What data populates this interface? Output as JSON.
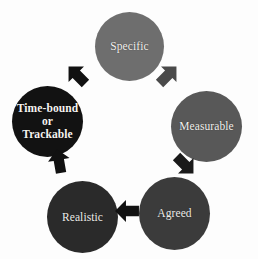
{
  "diagram": {
    "title": "SMART Goals Cycle",
    "type": "cycle-diagram",
    "background_color": "#fdfdfd",
    "direction": "clockwise",
    "nodes": [
      {
        "id": "specific",
        "label": "Specific",
        "position": "top",
        "fill_color": "#6e6e6e",
        "text_color": "#f3f2ee"
      },
      {
        "id": "measurable",
        "label": "Measurable",
        "position": "right",
        "fill_color": "#585858",
        "text_color": "#f3f2ee"
      },
      {
        "id": "agreed",
        "label": "Agreed",
        "position": "bottom-right",
        "fill_color": "#3b3b3b",
        "text_color": "#efeeea"
      },
      {
        "id": "realistic",
        "label": "Realistic",
        "position": "bottom-left",
        "fill_color": "#2a2a2a",
        "text_color": "#efeeea"
      },
      {
        "id": "timebound",
        "label": "Time-bound or Trackable",
        "label_line1": "Time-bound",
        "label_line2": "or Trackable",
        "position": "left",
        "fill_color": "#121212",
        "text_color": "#f5f4f0"
      }
    ],
    "arrows": [
      {
        "id": "timebound-to-specific",
        "from": "timebound",
        "to": "specific",
        "direction": "up-right",
        "color": "#111111"
      },
      {
        "id": "specific-to-measurable",
        "from": "specific",
        "to": "measurable",
        "direction": "down-right",
        "color": "#4a4a4a"
      },
      {
        "id": "measurable-to-agreed",
        "from": "measurable",
        "to": "agreed",
        "direction": "down-left",
        "color": "#1a1a1a"
      },
      {
        "id": "agreed-to-realistic",
        "from": "agreed",
        "to": "realistic",
        "direction": "left",
        "color": "#111111"
      },
      {
        "id": "realistic-to-timebound",
        "from": "realistic",
        "to": "timebound",
        "direction": "up",
        "color": "#111111"
      }
    ]
  }
}
